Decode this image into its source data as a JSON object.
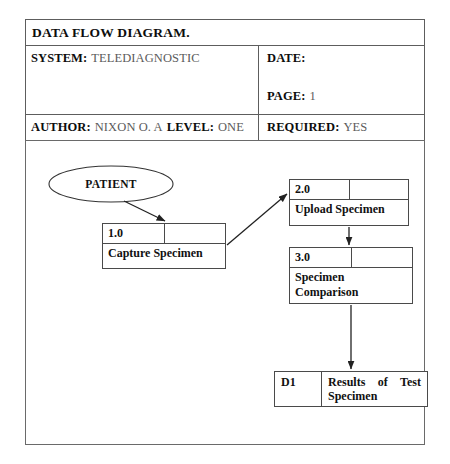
{
  "document": {
    "title": "DATA FLOW DIAGRAM.",
    "header": {
      "system_label": "SYSTEM:",
      "system_value": "TELEDIAGNOSTIC",
      "date_label": "DATE:",
      "date_value": "",
      "page_label": "PAGE:",
      "page_value": "1",
      "author_label": "AUTHOR:",
      "author_value": "NIXON O. A",
      "level_label": "LEVEL:",
      "level_value": "ONE",
      "required_label": "REQUIRED:",
      "required_value": "YES"
    }
  },
  "diagram": {
    "type": "data-flow-diagram",
    "external_entities": [
      {
        "id": "patient",
        "label": "PATIENT",
        "shape": "ellipse"
      }
    ],
    "processes": [
      {
        "id": "p1",
        "number": "1.0",
        "name": "Capture Specimen"
      },
      {
        "id": "p2",
        "number": "2.0",
        "name": "Upload Specimen"
      },
      {
        "id": "p3",
        "number": "3.0",
        "name": "Specimen Comparison"
      }
    ],
    "data_stores": [
      {
        "id": "d1",
        "code": "D1",
        "name": "Results of Test Specimen"
      }
    ],
    "flows": [
      {
        "from": "patient",
        "to": "p1"
      },
      {
        "from": "p1",
        "to": "p2"
      },
      {
        "from": "p2",
        "to": "p3"
      },
      {
        "from": "p3",
        "to": "d1"
      }
    ]
  },
  "colors": {
    "label_text": "#0d0d0d",
    "value_text": "#5b5b5b",
    "border": "#5d5d5d",
    "diagram_stroke": "#222222"
  }
}
